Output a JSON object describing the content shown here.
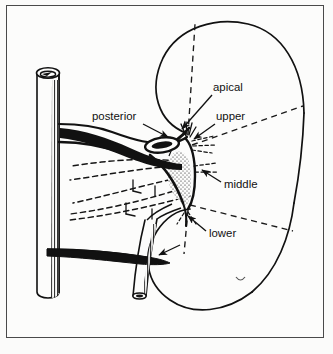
{
  "figure": {
    "kind": "anatomical-line-drawing",
    "background_color": "#fbfbfa",
    "ink_color": "#111111",
    "frame_color": "#4a4a4a"
  },
  "labels": [
    {
      "id": "posterior",
      "text": "posterior",
      "x": 92,
      "y": 120,
      "anchor": "start",
      "leader": {
        "x1": 143,
        "y1": 124,
        "x2": 168,
        "y2": 137
      }
    },
    {
      "id": "apical",
      "text": "apical",
      "x": 213,
      "y": 91,
      "anchor": "start",
      "leader": {
        "x1": 212,
        "y1": 95,
        "x2": 182,
        "y2": 129
      }
    },
    {
      "id": "upper",
      "text": "upper",
      "x": 216,
      "y": 120,
      "anchor": "start",
      "leader": {
        "x1": 215,
        "y1": 124,
        "x2": 194,
        "y2": 139
      }
    },
    {
      "id": "middle",
      "text": "middle",
      "x": 224,
      "y": 188,
      "anchor": "start",
      "leader": {
        "x1": 221,
        "y1": 182,
        "x2": 202,
        "y2": 170
      }
    },
    {
      "id": "lower",
      "text": "lower",
      "x": 209,
      "y": 237,
      "anchor": "start",
      "leader": {
        "x1": 206,
        "y1": 231,
        "x2": 188,
        "y2": 216
      }
    }
  ],
  "unlabeled_pointers": [
    {
      "id": "renal-vein-pointer",
      "x1": 180,
      "y1": 245,
      "x2": 159,
      "y2": 255
    }
  ],
  "structures": {
    "kidney_outline": "large bean-shaped renal contour occupying right two-thirds of the frame",
    "aorta": "vertical cylindrical vessel at left with elliptical lumen opening at top and hatched shading on right wall",
    "renal_artery": "horizontal trunk from aorta to hilum, dividing into segmental branches",
    "renal_vein": "thin tapering vessel crossing below the artery",
    "ureter": "tube descending from hilum toward lower left",
    "renal_pelvis": "stippled triangular region at the hilum",
    "segment_boundaries": "dashed radial lines dividing the renal parenchyma into vascular segments",
    "posterior_branches": "dashed vessel courses sweeping left behind the pelvis"
  }
}
